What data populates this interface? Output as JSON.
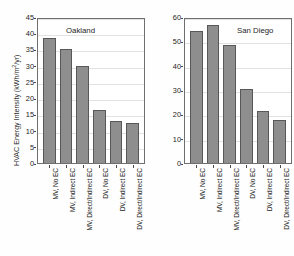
{
  "chart_data": [
    {
      "type": "bar",
      "title": "Oakland",
      "xlabel": "",
      "ylabel": "HVAC Energy Intensity (kWh/m2/yr)",
      "ylim": [
        0,
        45
      ],
      "yticks": [
        0,
        5,
        10,
        15,
        20,
        25,
        30,
        35,
        40,
        45
      ],
      "grid": true,
      "legend": "none",
      "categories": [
        "MV, No EC",
        "MV, Indirect EC",
        "MV, Direct/Indirect EC",
        "DV, No EC",
        "DV, Indirect EC",
        "DV, Direct/Indirect EC"
      ],
      "values": [
        38.4,
        35.2,
        29.8,
        16.3,
        13.1,
        12.2
      ],
      "bar_color": "#8e8e8e",
      "bar_edge_color": "#585858"
    },
    {
      "type": "bar",
      "title": "San Diego",
      "xlabel": "",
      "ylabel": "HVAC Energy Intensity (kWh/m2/yr)",
      "ylim": [
        0,
        60
      ],
      "yticks": [
        0,
        10,
        20,
        30,
        40,
        50,
        60
      ],
      "grid": true,
      "legend": "none",
      "categories": [
        "MV, No EC",
        "MV, Indirect EC",
        "MV, Direct/Indirect EC",
        "DV, No EC",
        "DV, Indirect EC",
        "DV, Direct/Indirect EC"
      ],
      "values": [
        54.4,
        56.8,
        48.3,
        30.5,
        21.5,
        17.7
      ],
      "bar_color": "#8e8e8e",
      "bar_edge_color": "#585858"
    }
  ],
  "axis": {
    "ylabel_main": "HVAC Energy Intensity (kWh/m",
    "ylabel_sup": "2",
    "ylabel_tail": "/yr)"
  }
}
